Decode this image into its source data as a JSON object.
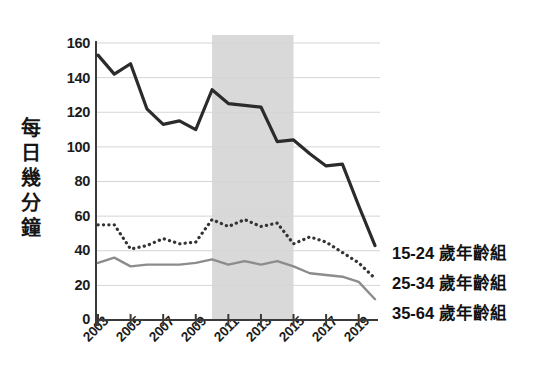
{
  "chart_data": {
    "type": "line",
    "title": "",
    "xlabel": "",
    "ylabel": "每日幾分鐘",
    "ylim": [
      0,
      160
    ],
    "xlim": [
      2003,
      2020
    ],
    "grid": true,
    "legend_position": "right",
    "yticks": [
      0,
      20,
      40,
      60,
      80,
      100,
      120,
      140,
      160
    ],
    "xticks": [
      2003,
      2005,
      2007,
      2009,
      2011,
      2013,
      2015,
      2017,
      2019
    ],
    "x": [
      2003,
      2004,
      2005,
      2006,
      2007,
      2008,
      2009,
      2010,
      2011,
      2012,
      2013,
      2014,
      2015,
      2016,
      2017,
      2018,
      2019,
      2020
    ],
    "shaded_region": {
      "start": 2010,
      "end": 2015,
      "color": "#d9d9d9"
    },
    "series": [
      {
        "name": "15-24 歲年齡組",
        "style": "solid",
        "color": "#2b2b2b",
        "values": [
          153,
          142,
          148,
          122,
          113,
          115,
          110,
          133,
          125,
          124,
          123,
          103,
          104,
          96,
          89,
          90,
          66,
          43
        ]
      },
      {
        "name": "25-34 歲年齡組",
        "style": "dotted",
        "color": "#333333",
        "values": [
          55,
          55,
          41,
          43,
          47,
          44,
          45,
          58,
          54,
          58,
          54,
          56,
          44,
          48,
          45,
          39,
          33,
          24
        ]
      },
      {
        "name": "35-64 歲年齡組",
        "style": "solid-light",
        "color": "#8c8c8c",
        "values": [
          33,
          36,
          31,
          32,
          32,
          32,
          33,
          35,
          32,
          34,
          32,
          34,
          31,
          27,
          26,
          25,
          22,
          12
        ]
      }
    ]
  },
  "axis": {
    "y_label_chars": [
      "每",
      "日",
      "幾",
      "分",
      "鐘"
    ],
    "y_tick_labels": [
      "160",
      "140",
      "120",
      "100",
      "80",
      "60",
      "40",
      "20",
      "0"
    ],
    "x_tick_labels": [
      "2003",
      "2005",
      "2007",
      "2009",
      "2011",
      "2013",
      "2015",
      "2017",
      "2019"
    ]
  },
  "legend": {
    "items": [
      {
        "label": "15-24 歲年齡組"
      },
      {
        "label": "25-34 歲年齡組"
      },
      {
        "label": "35-64 歲年齡組"
      }
    ]
  }
}
